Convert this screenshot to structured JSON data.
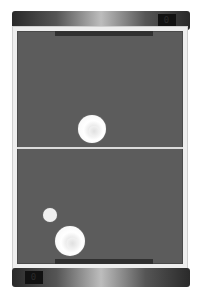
{
  "game": {
    "type": "air-hockey",
    "opponent_score": "0",
    "player_score": "0",
    "colors": {
      "table_felt": "#5c5c5c",
      "table_border": "#eeeeee",
      "bar_dark": "#2a2a2a",
      "bar_highlight": "#bdbdbd",
      "score_box": "#111111",
      "disc": "#ffffff"
    },
    "objects": {
      "opponent_mallet": {
        "x": 91,
        "y": 127,
        "r": 14
      },
      "puck": {
        "x": 50,
        "y": 215,
        "r": 7
      },
      "player_mallet": {
        "x": 67,
        "y": 238,
        "r": 15
      }
    }
  }
}
